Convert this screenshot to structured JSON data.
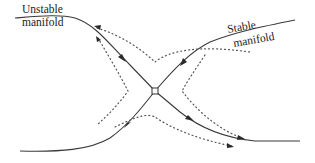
{
  "figure": {
    "type": "saddle-point phase portrait",
    "labels": {
      "unstable_line1": "Unstable",
      "unstable_line2": "manifold",
      "stable_line1": "Stable",
      "stable_line2": "manifold"
    },
    "elements": {
      "saddle_point": {
        "x": 155,
        "y": 91,
        "marker": "open circle"
      },
      "manifolds": [
        {
          "name": "unstable-manifold",
          "from": "top-left",
          "to": "bottom-right",
          "style": "solid",
          "arrow_directions_observed": [
            "top-left branch: toward saddle",
            "bottom-right branch: away from saddle"
          ]
        },
        {
          "name": "stable-manifold",
          "from": "top-right",
          "to": "bottom-left",
          "style": "solid",
          "arrow_directions_observed": [
            "top-right branch: toward saddle",
            "bottom-left branch: toward saddle"
          ]
        }
      ],
      "trajectories": [
        {
          "quadrant": "top",
          "style": "dotted"
        },
        {
          "quadrant": "left",
          "style": "dotted"
        },
        {
          "quadrant": "right",
          "style": "dotted"
        },
        {
          "quadrant": "bottom",
          "style": "dotted"
        }
      ]
    }
  }
}
